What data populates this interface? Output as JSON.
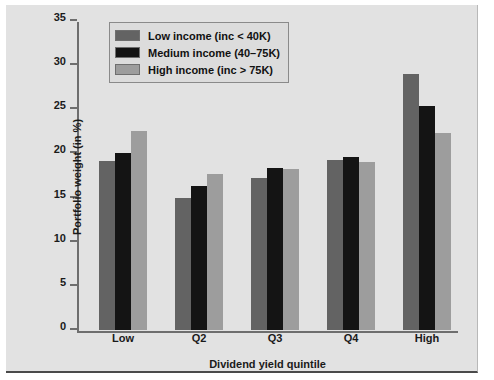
{
  "chart_data": {
    "type": "bar",
    "title": "",
    "subtitle": "",
    "xlabel": "Dividend yield quintile",
    "ylabel": "Portfolio weight (in %)",
    "categories": [
      "Low",
      "Q2",
      "Q3",
      "Q4",
      "High"
    ],
    "series": [
      {
        "name": "Low income (inc < 40K)",
        "color": "#636363",
        "values": [
          19.2,
          14.9,
          17.2,
          19.3,
          29.0
        ]
      },
      {
        "name": "Medium income (40–75K)",
        "color": "#141414",
        "values": [
          20.1,
          16.3,
          18.3,
          19.6,
          25.4
        ]
      },
      {
        "name": "High income (inc > 75K)",
        "color": "#9d9d9d",
        "values": [
          22.5,
          17.7,
          18.2,
          19.0,
          22.3
        ]
      }
    ],
    "ylim": [
      0,
      35
    ],
    "yticks": [
      0,
      5,
      10,
      15,
      20,
      25,
      30,
      35
    ],
    "ytick_labels": [
      "0",
      "5",
      "10",
      "15",
      "20",
      "25",
      "30",
      "35"
    ],
    "grid": false,
    "legend_position": "upper-left",
    "background_color": "#e2e2e2"
  }
}
